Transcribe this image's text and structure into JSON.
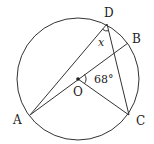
{
  "diagram": {
    "type": "circle-geometry",
    "circle": {
      "center": "O",
      "cx": 78,
      "cy": 79,
      "r": 61
    },
    "points": {
      "A": {
        "label": "A",
        "x": 30,
        "y": 115
      },
      "B": {
        "label": "B",
        "x": 128,
        "y": 43
      },
      "C": {
        "label": "C",
        "x": 129,
        "y": 115
      },
      "D": {
        "label": "D",
        "x": 107,
        "y": 24
      },
      "O": {
        "label": "O",
        "x": 78,
        "y": 79
      }
    },
    "segments": [
      "AD",
      "AB",
      "OC",
      "DC"
    ],
    "angles": {
      "central": {
        "label": "68°",
        "vertex": "O",
        "between": [
          "B",
          "C"
        ]
      },
      "inscribed": {
        "label": "x",
        "vertex": "D",
        "between": [
          "A",
          "C"
        ]
      }
    },
    "colors": {
      "stroke": "#333333",
      "text": "#222222",
      "background": "#ffffff"
    }
  }
}
